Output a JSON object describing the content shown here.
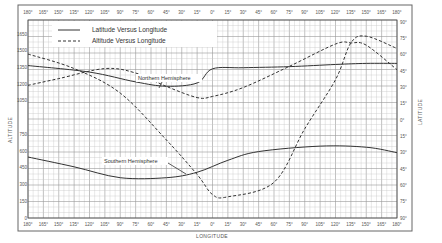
{
  "chart_data": {
    "type": "line",
    "title": "",
    "xlabel": "LONGITUDE",
    "ylabel": "ALTITUDE",
    "y2label": "LATITUDE",
    "x_tick_labels": [
      "180°",
      "165°",
      "150°",
      "135°",
      "120°",
      "105°",
      "90°",
      "75°",
      "60°",
      "45°",
      "30°",
      "15°",
      "0°",
      "15°",
      "30°",
      "45°",
      "60°",
      "75°",
      "90°",
      "105°",
      "120°",
      "135°",
      "150°",
      "165°",
      "180°"
    ],
    "y_tick_labels": [
      "1650",
      "1500",
      "1350",
      "1200",
      "1050",
      "750",
      "600",
      "450",
      "300",
      "150",
      "0"
    ],
    "y2_tick_labels": [
      "90°",
      "75°",
      "60°",
      "45°",
      "30°",
      "15°",
      "0°",
      "15°",
      "30°",
      "45°",
      "60°",
      "75°",
      "90°"
    ],
    "xlim": [
      -180,
      180
    ],
    "ylim": [
      0,
      1650
    ],
    "y2lim": [
      -90,
      90
    ],
    "grid": true,
    "legend": {
      "position": "upper-left",
      "entries": [
        {
          "label": "Latitude  Versus  Longitude",
          "style": "solid"
        },
        {
          "label": "Altitude  Versus  Longitude",
          "style": "dashed"
        }
      ]
    },
    "annotations": [
      {
        "text": "Northern Hemisphere",
        "x": -45,
        "y": 1190
      },
      {
        "text": "Southern Hemisphere",
        "x": -30,
        "y": 340
      }
    ],
    "series": [
      {
        "name": "Northern Hemisphere - Latitude vs Longitude",
        "style": "solid",
        "axis": "latitude",
        "x": [
          -180,
          -120,
          -75,
          -45,
          -15,
          0,
          30,
          75,
          120,
          150,
          180
        ],
        "values": [
          50,
          44,
          35,
          31,
          34,
          47,
          48,
          49,
          51,
          52,
          52
        ]
      },
      {
        "name": "Northern Hemisphere - Altitude vs Longitude",
        "style": "dashed",
        "axis": "altitude",
        "x": [
          -180,
          -150,
          -105,
          -75,
          -45,
          -15,
          0,
          30,
          75,
          120,
          135,
          150,
          180
        ],
        "values": [
          1190,
          1250,
          1340,
          1300,
          1180,
          1080,
          1090,
          1170,
          1360,
          1560,
          1570,
          1550,
          1330
        ]
      },
      {
        "name": "Southern Hemisphere - Altitude vs Longitude",
        "style": "dashed",
        "axis": "altitude",
        "x": [
          -180,
          -135,
          -90,
          -45,
          -15,
          0,
          15,
          60,
          90,
          120,
          135,
          150,
          180
        ],
        "values": [
          1470,
          1340,
          1120,
          700,
          390,
          210,
          190,
          320,
          800,
          1240,
          1570,
          1630,
          1520
        ]
      },
      {
        "name": "Southern Hemisphere - Latitude vs Longitude",
        "style": "solid",
        "axis": "latitude",
        "x": [
          -180,
          -135,
          -90,
          -45,
          -15,
          15,
          45,
          105,
          150,
          180
        ],
        "values": [
          -34,
          -43,
          -53,
          -53,
          -48,
          -37,
          -29,
          -24,
          -25,
          -30
        ]
      }
    ]
  }
}
